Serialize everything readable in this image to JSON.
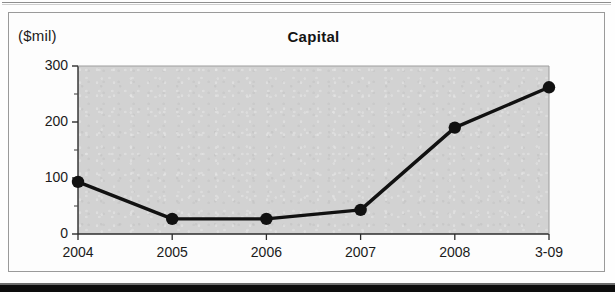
{
  "figure": {
    "unit_label": "($mil)",
    "title": "Capital"
  },
  "chart_data": {
    "type": "line",
    "title": "Capital",
    "xlabel": "",
    "ylabel": "($mil)",
    "ylim": [
      0,
      300
    ],
    "yticks": [
      0,
      100,
      200,
      300
    ],
    "yminorticks": [
      50,
      150,
      250
    ],
    "grid": false,
    "legend": "none",
    "plot_background": "#d2d2d2",
    "line_color": "#111111",
    "marker": "circle-filled",
    "categories": [
      "2004",
      "2005",
      "2006",
      "2007",
      "2008",
      "3-09"
    ],
    "values": [
      93,
      27,
      27,
      43,
      190,
      262
    ],
    "series": [
      {
        "name": "Capital",
        "values": [
          93,
          27,
          27,
          43,
          190,
          262
        ]
      }
    ]
  }
}
